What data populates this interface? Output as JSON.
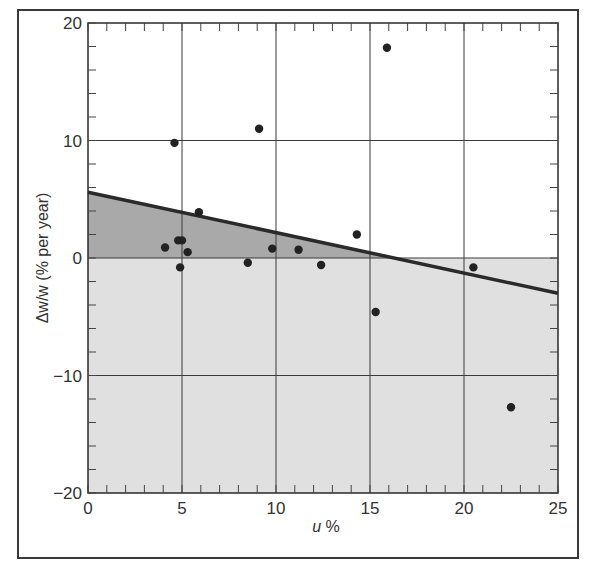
{
  "chart_data": {
    "type": "scatter",
    "title": "",
    "xlabel": "u %",
    "ylabel": "Δw/w (% per year)",
    "xlim": [
      0,
      25
    ],
    "ylim": [
      -20,
      20
    ],
    "x_ticks": [
      0,
      5,
      10,
      15,
      20,
      25
    ],
    "y_ticks": [
      -20,
      -10,
      0,
      10,
      20
    ],
    "x_minor_step": 1,
    "y_minor_step": 2,
    "grid": true,
    "legend": null,
    "series": [
      {
        "name": "observations",
        "type": "scatter",
        "points": [
          {
            "x": 4.1,
            "y": 0.9
          },
          {
            "x": 4.6,
            "y": 9.8
          },
          {
            "x": 4.8,
            "y": 1.5
          },
          {
            "x": 5.0,
            "y": 1.5
          },
          {
            "x": 4.9,
            "y": -0.8
          },
          {
            "x": 5.3,
            "y": 0.5
          },
          {
            "x": 5.9,
            "y": 3.9
          },
          {
            "x": 8.5,
            "y": -0.4
          },
          {
            "x": 9.1,
            "y": 11.0
          },
          {
            "x": 9.8,
            "y": 0.8
          },
          {
            "x": 11.2,
            "y": 0.7
          },
          {
            "x": 12.4,
            "y": -0.6
          },
          {
            "x": 14.3,
            "y": 2.0
          },
          {
            "x": 15.3,
            "y": -4.6
          },
          {
            "x": 15.9,
            "y": 17.9
          },
          {
            "x": 20.5,
            "y": -0.8
          },
          {
            "x": 22.5,
            "y": -12.7
          }
        ]
      },
      {
        "name": "fitted Phillips curve",
        "type": "line",
        "points": [
          {
            "x": 0,
            "y": 5.6
          },
          {
            "x": 25,
            "y": -3.0
          }
        ]
      }
    ],
    "shaded_regions": [
      {
        "name": "below-zero region",
        "y_range": [
          -20,
          0
        ],
        "color": "#e0e0e0"
      },
      {
        "name": "between curve and zero",
        "color": "#a9a9a9"
      }
    ],
    "colors": {
      "dot": "#222222",
      "line": "#2a2a2a",
      "grid": "#3a3a3a",
      "dark_shade": "#a9a9a9",
      "light_shade": "#e0e0e0"
    }
  }
}
